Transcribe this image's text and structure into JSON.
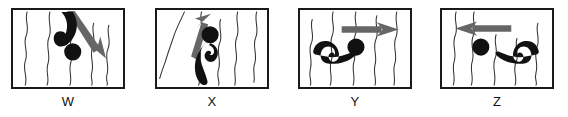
{
  "figure": {
    "title": "",
    "panel_count": 4,
    "colors": {
      "frame": "#1a1a1a",
      "background": "#ffffff",
      "figure_fill": "#111111",
      "arrow_fill": "#555555",
      "water_line": "#333333",
      "label_text": "#111111"
    },
    "panels": [
      {
        "id": "w",
        "label": "W",
        "swimmer": {
          "orientation": "vertical-head-down",
          "description": "swimmer with head low and curved body above, diving downward",
          "head_position": "lower-middle",
          "body_curve": "hook opening left"
        },
        "arrow": {
          "name": "arrow-down-right",
          "direction": "down-right",
          "angle_degrees": 55,
          "description": "arrow pointing diagonally down and to the right"
        },
        "water_lines": 5,
        "water_orientation": "vertical"
      },
      {
        "id": "x",
        "label": "X",
        "swimmer": {
          "orientation": "vertical-head-up",
          "description": "swimmer with head on top and curved body below, rising upward",
          "head_position": "upper-middle",
          "body_curve": "hook opening right"
        },
        "arrow": {
          "name": "arrow-up",
          "direction": "up",
          "angle_degrees": -75,
          "description": "arrow pointing up and slightly to the right"
        },
        "water_lines": 5,
        "water_orientation": "vertical"
      },
      {
        "id": "y",
        "label": "Y",
        "swimmer": {
          "orientation": "horizontal-head-right",
          "description": "swimmer lying horizontally with head on the right and curved body to the left",
          "head_position": "right",
          "body_curve": "arch opening down"
        },
        "arrow": {
          "name": "arrow-right",
          "direction": "right",
          "angle_degrees": 0,
          "description": "horizontal arrow pointing to the right"
        },
        "water_lines": 5,
        "water_orientation": "vertical"
      },
      {
        "id": "z",
        "label": "Z",
        "swimmer": {
          "orientation": "horizontal-head-left",
          "description": "swimmer lying horizontally with head on the left and curved body to the right",
          "head_position": "left",
          "body_curve": "arch opening down"
        },
        "arrow": {
          "name": "arrow-left",
          "direction": "left",
          "angle_degrees": 180,
          "description": "horizontal arrow pointing to the left"
        },
        "water_lines": 5,
        "water_orientation": "vertical"
      }
    ]
  }
}
